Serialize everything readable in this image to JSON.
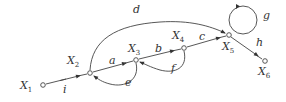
{
  "diagram": {
    "type": "signal-flow-graph",
    "nodes": [
      {
        "id": "X1",
        "label": "X",
        "sub": "1",
        "x": 43,
        "y": 85
      },
      {
        "id": "X2",
        "label": "X",
        "sub": "2",
        "x": 90,
        "y": 73
      },
      {
        "id": "X3",
        "label": "X",
        "sub": "3",
        "x": 136,
        "y": 60
      },
      {
        "id": "X4",
        "label": "X",
        "sub": "4",
        "x": 184,
        "y": 48
      },
      {
        "id": "X5",
        "label": "X",
        "sub": "5",
        "x": 229,
        "y": 35
      },
      {
        "id": "X6",
        "label": "X",
        "sub": "6",
        "x": 265,
        "y": 61
      }
    ],
    "edges": [
      {
        "from": "X1",
        "to": "X2",
        "label": "i"
      },
      {
        "from": "X2",
        "to": "X3",
        "label": "a"
      },
      {
        "from": "X3",
        "to": "X2",
        "label": "e"
      },
      {
        "from": "X3",
        "to": "X4",
        "label": "b"
      },
      {
        "from": "X4",
        "to": "X3",
        "label": "f"
      },
      {
        "from": "X4",
        "to": "X5",
        "label": "c"
      },
      {
        "from": "X2",
        "to": "X5",
        "label": "d"
      },
      {
        "from": "X5",
        "to": "X5",
        "label": "g"
      },
      {
        "from": "X5",
        "to": "X6",
        "label": "h"
      }
    ]
  },
  "labels": {
    "X1": "X",
    "X1_sub": "1",
    "X2": "X",
    "X2_sub": "2",
    "X3": "X",
    "X3_sub": "3",
    "X4": "X",
    "X4_sub": "4",
    "X5": "X",
    "X5_sub": "5",
    "X6": "X",
    "X6_sub": "6",
    "i": "i",
    "a": "a",
    "e": "e",
    "b": "b",
    "f": "f",
    "c": "c",
    "d": "d",
    "g": "g",
    "h": "h"
  }
}
